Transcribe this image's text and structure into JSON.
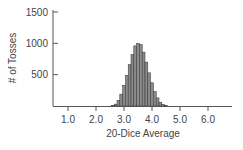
{
  "chart_data": {
    "type": "bar",
    "title": "",
    "xlabel": "20-Dice Average",
    "ylabel": "# of Tosses",
    "xlim": [
      0.45,
      6.85
    ],
    "ylim": [
      0,
      1500
    ],
    "x_ticks": [
      1.0,
      2.0,
      3.0,
      4.0,
      5.0,
      6.0
    ],
    "x_tick_labels": [
      "1.0",
      "2.0",
      "3.0",
      "4.0",
      "5.0",
      "6.0"
    ],
    "y_ticks": [
      500,
      1000,
      1500
    ],
    "y_tick_labels": [
      "500",
      "1000",
      "1500"
    ],
    "grid": false,
    "legend": null,
    "bin_width": 0.1,
    "x": [
      2.6,
      2.7,
      2.8,
      2.9,
      3.0,
      3.1,
      3.2,
      3.3,
      3.4,
      3.5,
      3.6,
      3.7,
      3.8,
      3.9,
      4.0,
      4.1,
      4.2,
      4.3,
      4.4,
      4.5
    ],
    "values": [
      10,
      30,
      90,
      190,
      330,
      490,
      660,
      820,
      960,
      1000,
      980,
      860,
      700,
      530,
      370,
      230,
      130,
      60,
      25,
      10
    ],
    "bar_color": "#8a8a8a",
    "bar_edge_color": "#333333",
    "axis_color": "#555555"
  }
}
